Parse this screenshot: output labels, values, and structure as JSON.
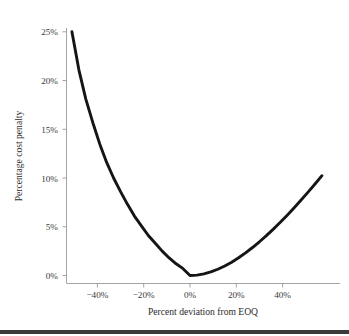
{
  "chart_data": {
    "type": "line",
    "title": "",
    "xlabel": "Percent deviation from EOQ",
    "ylabel": "Percentage cost penalty",
    "xlim": [
      -52,
      58
    ],
    "ylim": [
      -0.6,
      26
    ],
    "grid": false,
    "legend": null,
    "xticks": [
      -40,
      -20,
      0,
      20,
      40
    ],
    "xticklabels": [
      "−40%",
      "−20%",
      "0%",
      "20%",
      "40%"
    ],
    "yticks": [
      0,
      5,
      10,
      15,
      20,
      25
    ],
    "yticklabels": [
      "0%",
      "5%",
      "10%",
      "15%",
      "20%",
      "25%"
    ],
    "series": [
      {
        "name": "EOQ cost penalty",
        "color": "#151515",
        "formula": "0.5 * (q + 1/q) - 1, q = 1 + d/100",
        "x": [
          -51,
          -48,
          -45,
          -42,
          -39,
          -36,
          -33,
          -30,
          -27,
          -24,
          -21,
          -18,
          -15,
          -12,
          -9,
          -6,
          -3,
          0,
          3,
          6,
          9,
          12,
          15,
          18,
          21,
          24,
          27,
          30,
          33,
          36,
          39,
          42,
          45,
          48,
          51,
          54,
          57
        ],
        "y": [
          25.0,
          21.1,
          18.1,
          15.7,
          13.5,
          11.6,
          10.0,
          8.6,
          7.3,
          6.1,
          5.1,
          4.1,
          3.3,
          2.5,
          1.8,
          1.2,
          0.7,
          0.0,
          0.04,
          0.17,
          0.37,
          0.64,
          0.98,
          1.37,
          1.82,
          2.32,
          2.87,
          3.46,
          4.09,
          4.76,
          5.46,
          6.19,
          6.95,
          7.74,
          8.55,
          9.38,
          10.24
        ]
      }
    ]
  },
  "axes": {
    "x_title": "Percent deviation from EOQ",
    "y_title": "Percentage cost penalty",
    "x_tick_0": "−40%",
    "x_tick_1": "−20%",
    "x_tick_2": "0%",
    "x_tick_3": "20%",
    "x_tick_4": "40%",
    "y_tick_0": "0%",
    "y_tick_1": "5%",
    "y_tick_2": "10%",
    "y_tick_3": "15%",
    "y_tick_4": "20%",
    "y_tick_5": "25%"
  },
  "style": {
    "curve_color": "#151515",
    "axis_color": "#9a9a9a",
    "text_color": "#2b2b2b",
    "background": "#ffffff",
    "footer_bar_color": "#3b3b3b"
  }
}
